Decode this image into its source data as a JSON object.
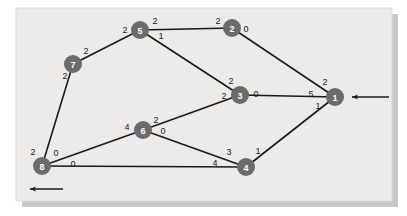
{
  "figure": {
    "type": "network-graph",
    "canvas": {
      "width": 407,
      "height": 216
    },
    "panel": {
      "x": 16,
      "y": 8,
      "width": 376,
      "height": 193
    },
    "colors": {
      "panel_background": "#ecebe9",
      "panel_shadow": "#c9c8c6",
      "panel_border": "#d6d5d3",
      "node_fill": "#6b6b6b",
      "node_label": "#ffffff",
      "edge_stroke": "#1a1a1a",
      "weight_text": "#1a1a1a",
      "page_background": "#ffffff"
    },
    "node_radius": 9,
    "edge_width": 1.6
  },
  "graph_data": {
    "type": "network",
    "directed": false,
    "node_count": 8,
    "edge_count": 11,
    "nodes": [
      {
        "id": "1",
        "label": "1",
        "x": 335,
        "y": 97
      },
      {
        "id": "2",
        "label": "2",
        "x": 232,
        "y": 28
      },
      {
        "id": "3",
        "label": "3",
        "x": 240,
        "y": 95
      },
      {
        "id": "4",
        "label": "4",
        "x": 246,
        "y": 167
      },
      {
        "id": "5",
        "label": "5",
        "x": 140,
        "y": 30
      },
      {
        "id": "6",
        "label": "6",
        "x": 143,
        "y": 130
      },
      {
        "id": "7",
        "label": "7",
        "x": 73,
        "y": 64
      },
      {
        "id": "8",
        "label": "8",
        "x": 42,
        "y": 166
      }
    ],
    "edges": [
      {
        "id": "e-5-2",
        "source": "5",
        "target": "2",
        "source_weight": "2",
        "target_weight": "2",
        "source_weight_pos": {
          "x": 155,
          "y": 21
        },
        "target_weight_pos": {
          "x": 218,
          "y": 21
        }
      },
      {
        "id": "e-7-5",
        "source": "7",
        "target": "5",
        "source_weight": "2",
        "target_weight": "2",
        "source_weight_pos": {
          "x": 86,
          "y": 51
        },
        "target_weight_pos": {
          "x": 125,
          "y": 30
        }
      },
      {
        "id": "e-7-8",
        "source": "7",
        "target": "8",
        "source_weight": "2",
        "target_weight": "2",
        "source_weight_pos": {
          "x": 65,
          "y": 76
        },
        "target_weight_pos": {
          "x": 33,
          "y": 152
        }
      },
      {
        "id": "e-5-3",
        "source": "5",
        "target": "3",
        "source_weight": "1",
        "target_weight": "2",
        "source_weight_pos": {
          "x": 161,
          "y": 36
        },
        "target_weight_pos": {
          "x": 231,
          "y": 81
        }
      },
      {
        "id": "e-2-1",
        "source": "2",
        "target": "1",
        "source_weight": "0",
        "target_weight": "2",
        "source_weight_pos": {
          "x": 246,
          "y": 29
        },
        "target_weight_pos": {
          "x": 325,
          "y": 82
        }
      },
      {
        "id": "e-3-1",
        "source": "3",
        "target": "1",
        "source_weight": "0",
        "target_weight": "5",
        "source_weight_pos": {
          "x": 256,
          "y": 94
        },
        "target_weight_pos": {
          "x": 311,
          "y": 94
        }
      },
      {
        "id": "e-4-1",
        "source": "4",
        "target": "1",
        "source_weight": "1",
        "target_weight": "1",
        "source_weight_pos": {
          "x": 258,
          "y": 151
        },
        "target_weight_pos": {
          "x": 318,
          "y": 106
        }
      },
      {
        "id": "e-6-3",
        "source": "6",
        "target": "3",
        "source_weight": "2",
        "target_weight": "2",
        "source_weight_pos": {
          "x": 156,
          "y": 120
        },
        "target_weight_pos": {
          "x": 224,
          "y": 96
        }
      },
      {
        "id": "e-8-6",
        "source": "8",
        "target": "6",
        "source_weight": "0",
        "target_weight": "4",
        "source_weight_pos": {
          "x": 56,
          "y": 153
        },
        "target_weight_pos": {
          "x": 127,
          "y": 127
        }
      },
      {
        "id": "e-8-4",
        "source": "8",
        "target": "4",
        "source_weight": "0",
        "target_weight": "4",
        "source_weight_pos": {
          "x": 73,
          "y": 164
        },
        "target_weight_pos": {
          "x": 215,
          "y": 163
        }
      },
      {
        "id": "e-6-4",
        "source": "6",
        "target": "4",
        "source_weight": "0",
        "target_weight": "3",
        "source_weight_pos": {
          "x": 163,
          "y": 131
        },
        "target_weight_pos": {
          "x": 229,
          "y": 152
        }
      }
    ],
    "external_arrows": [
      {
        "id": "inflow-arrow",
        "name": "input-arrow-node-1",
        "direction": "left",
        "attached_node": "1",
        "x1": 389,
        "y1": 97,
        "x2": 350,
        "y2": 97
      },
      {
        "id": "outflow-arrow",
        "name": "output-arrow-node-8",
        "direction": "left",
        "attached_node": "8",
        "x1": 63,
        "y1": 189,
        "x2": 28,
        "y2": 189
      }
    ]
  }
}
